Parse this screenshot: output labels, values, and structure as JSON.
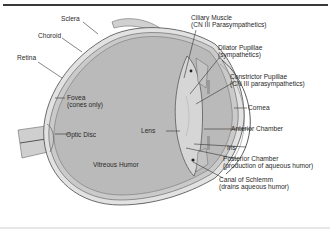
{
  "diagram": {
    "type": "anatomical-cross-section",
    "colors": {
      "vitreous": "#b9b9b9",
      "sclera": "#dedede",
      "outline": "#4a4a4a",
      "lens": "#d4d4d4",
      "label_text": "#2a2a2a",
      "leader_line": "#333333"
    }
  },
  "labels": {
    "sclera": {
      "text": "Sclera"
    },
    "choroid": {
      "text": "Choroid"
    },
    "retina": {
      "text": "Retina"
    },
    "fovea": {
      "text": "Fovea",
      "note": "(cones only)"
    },
    "optic_disc": {
      "text": "Optic Disc"
    },
    "vitreous_humor": {
      "text": "Vitreous Humor"
    },
    "lens": {
      "text": "Lens"
    },
    "ciliary_muscle": {
      "text": "Ciliary Muscle",
      "note": "(CN III Parasympathetics)"
    },
    "dilator_pupillae": {
      "text": "Dilator Pupillae",
      "note": "(sympathetics)"
    },
    "constrictor_pupillae": {
      "text": "Constrictor Pupillae",
      "note": "(CN III parasympathetics)"
    },
    "cornea": {
      "text": "Cornea"
    },
    "anterior_chamber": {
      "text": "Anterior Chamber"
    },
    "iris": {
      "text": "Iris"
    },
    "posterior_chamber": {
      "text": "Posterior Chamber",
      "note": "(production of aqueous humor)"
    },
    "canal_of_schlemm": {
      "text": "Canal of Schlemm",
      "note": "(drains aqueous humor)"
    }
  }
}
